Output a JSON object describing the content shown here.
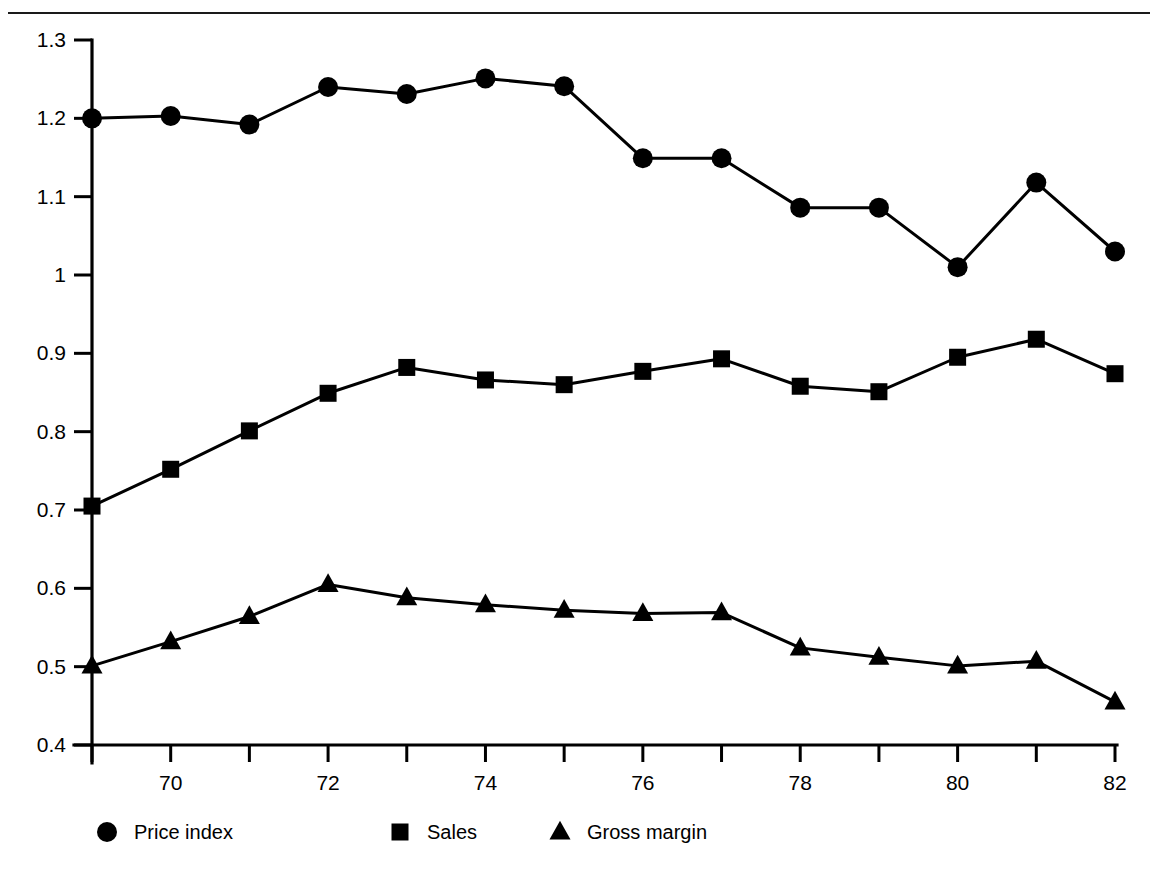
{
  "figure": {
    "background_color": "#ffffff",
    "ink_color": "#000000",
    "top_rule": true
  },
  "chart_data": {
    "type": "line",
    "title": "",
    "subtitle": "",
    "xlabel": "",
    "ylabel": "",
    "x": [
      69,
      70,
      71,
      72,
      73,
      74,
      75,
      76,
      77,
      78,
      79,
      80,
      81,
      82
    ],
    "xlim": [
      69,
      82
    ],
    "ylim": [
      0.4,
      1.3
    ],
    "xticks": [
      69,
      70,
      71,
      72,
      73,
      74,
      75,
      76,
      77,
      78,
      79,
      80,
      81,
      82
    ],
    "xtick_labels": [
      "",
      "70",
      "",
      "72",
      "",
      "74",
      "",
      "76",
      "",
      "78",
      "",
      "80",
      "",
      "82"
    ],
    "yticks": [
      0.4,
      0.5,
      0.6,
      0.7,
      0.8,
      0.9,
      1.0,
      1.1,
      1.2,
      1.3
    ],
    "ytick_labels": [
      "0.4",
      "0.5",
      "0.6",
      "0.7",
      "0.8",
      "0.9",
      "1",
      "1.1",
      "1.2",
      "1.3"
    ],
    "grid": false,
    "legend_position": "bottom",
    "series": [
      {
        "name": "Price index",
        "marker": "circle",
        "color": "#000000",
        "values": [
          1.2,
          1.203,
          1.192,
          1.24,
          1.231,
          1.251,
          1.241,
          1.149,
          1.149,
          1.086,
          1.086,
          1.01,
          1.118,
          1.03
        ]
      },
      {
        "name": "Sales",
        "marker": "square",
        "color": "#000000",
        "values": [
          0.705,
          0.752,
          0.801,
          0.849,
          0.882,
          0.866,
          0.86,
          0.877,
          0.893,
          0.858,
          0.851,
          0.895,
          0.918,
          0.874
        ]
      },
      {
        "name": "Gross margin",
        "marker": "triangle",
        "color": "#000000",
        "values": [
          0.501,
          0.532,
          0.564,
          0.605,
          0.588,
          0.579,
          0.572,
          0.568,
          0.569,
          0.524,
          0.512,
          0.501,
          0.507,
          0.455
        ]
      }
    ]
  },
  "legend": {
    "items": [
      {
        "label": "Price index",
        "marker": "circle-marker-icon"
      },
      {
        "label": "Sales",
        "marker": "square-marker-icon"
      },
      {
        "label": "Gross margin",
        "marker": "triangle-marker-icon"
      }
    ]
  }
}
